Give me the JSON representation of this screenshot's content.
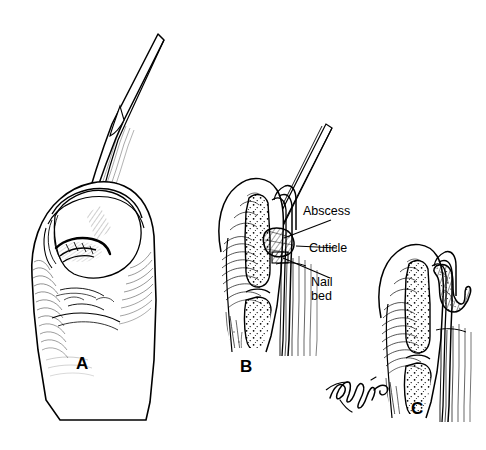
{
  "figure": {
    "background_color": "#ffffff",
    "ink_color": "#000000",
    "style": "pen-and-ink medical line illustration"
  },
  "panels": [
    {
      "id": "A",
      "letter": "A",
      "caption": "Fingertip with scalpel blade elevating the eponychial nail fold",
      "subject": "finger-with-scalpel"
    },
    {
      "id": "B",
      "letter": "B",
      "caption": "Sagittal cross-section showing blade entering the abscess at the cuticle",
      "subject": "sagittal-section-with-blade"
    },
    {
      "id": "C",
      "letter": "C",
      "caption": "Sagittal cross-section after drainage of purulent collection",
      "subject": "sagittal-section-drained"
    }
  ],
  "annotations": [
    {
      "id": "abscess",
      "label": "Abscess"
    },
    {
      "id": "cuticle",
      "label": "Cuticle"
    },
    {
      "id": "nail-bed",
      "label": "Nail\nbed"
    }
  ],
  "signature": {
    "text": "Tagim",
    "type": "artist-signature"
  }
}
